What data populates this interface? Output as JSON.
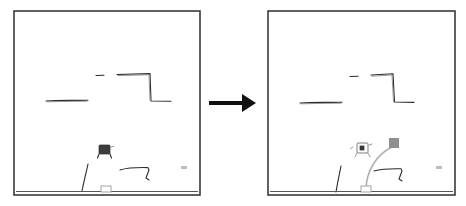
{
  "figure": {
    "background_color": "#ffffff",
    "panel_border_color": "#3a3a3a",
    "sketch_color": "#2b2b2b",
    "trajectory_color": "#b0b0b0",
    "target_color": "#8f8f8f",
    "arrow_color": "#111111",
    "caption": ""
  },
  "panels": [
    {
      "id": "left",
      "name": "before-panel",
      "label": "",
      "x": 14,
      "y": 11,
      "width": 186,
      "height": 184,
      "has_trajectory": false,
      "has_target_marker": false,
      "robot_state": "dark",
      "elements": [
        {
          "name": "wall-shelf-left",
          "type": "horizontal-stroke"
        },
        {
          "name": "wall-tick-upper",
          "type": "short-stroke"
        },
        {
          "name": "step-ledge",
          "type": "step-polyline"
        },
        {
          "name": "robot-gripper",
          "type": "robot"
        },
        {
          "name": "diagonal-stroke",
          "type": "curve"
        },
        {
          "name": "hook-bracket",
          "type": "polyline"
        },
        {
          "name": "floor",
          "type": "floor-line"
        },
        {
          "name": "floor-box",
          "type": "small-box"
        },
        {
          "name": "corner-speck",
          "type": "speck"
        }
      ]
    },
    {
      "id": "right",
      "name": "after-panel",
      "label": "",
      "x": 268,
      "y": 11,
      "width": 187,
      "height": 184,
      "has_trajectory": true,
      "has_target_marker": true,
      "robot_state": "light",
      "elements": [
        {
          "name": "wall-shelf-left",
          "type": "horizontal-stroke"
        },
        {
          "name": "wall-tick-upper",
          "type": "short-stroke"
        },
        {
          "name": "step-ledge",
          "type": "step-polyline"
        },
        {
          "name": "robot-gripper",
          "type": "robot"
        },
        {
          "name": "target-marker",
          "type": "filled-square"
        },
        {
          "name": "trajectory-arc",
          "type": "arc"
        },
        {
          "name": "diagonal-stroke",
          "type": "curve"
        },
        {
          "name": "hook-bracket",
          "type": "polyline"
        },
        {
          "name": "floor",
          "type": "floor-line"
        },
        {
          "name": "floor-box",
          "type": "small-box"
        },
        {
          "name": "corner-speck",
          "type": "speck"
        }
      ]
    }
  ],
  "arrow": {
    "name": "transition-arrow",
    "direction": "right",
    "label": "",
    "x1": 209,
    "x2": 256,
    "y": 103
  }
}
